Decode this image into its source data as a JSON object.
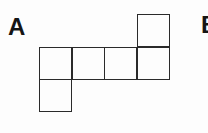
{
  "labels": {
    "a": "A",
    "b": "B"
  },
  "net": {
    "description": "Cube net of 6 squares",
    "cells": [
      {
        "row": 0,
        "col": 3
      },
      {
        "row": 1,
        "col": 0
      },
      {
        "row": 1,
        "col": 1
      },
      {
        "row": 1,
        "col": 2
      },
      {
        "row": 1,
        "col": 3
      },
      {
        "row": 2,
        "col": 0
      }
    ],
    "stroke_color": "#2a2a2a"
  }
}
